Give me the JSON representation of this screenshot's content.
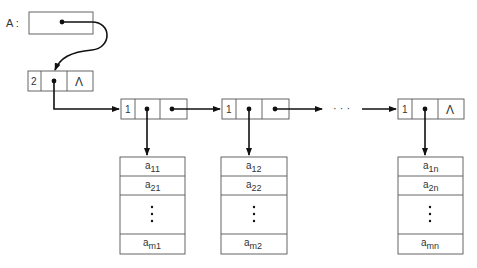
{
  "diagram": {
    "pointer_label": "A :",
    "head_node": {
      "count": "2",
      "null_symbol": "Λ"
    },
    "column_nodes": [
      {
        "tag": "1"
      },
      {
        "tag": "1"
      },
      {
        "tag": "1",
        "null_symbol": "Λ"
      }
    ],
    "ellipsis": "· · ·",
    "columns": [
      {
        "cells": [
          "a",
          "a",
          "⋮",
          "a"
        ],
        "subs": [
          "11",
          "21",
          "",
          "m1"
        ]
      },
      {
        "cells": [
          "a",
          "a",
          "⋮",
          "a"
        ],
        "subs": [
          "12",
          "22",
          "",
          "m2"
        ]
      },
      {
        "cells": [
          "a",
          "a",
          "⋮",
          "a"
        ],
        "subs": [
          "1n",
          "2n",
          "",
          "mn"
        ]
      }
    ]
  }
}
